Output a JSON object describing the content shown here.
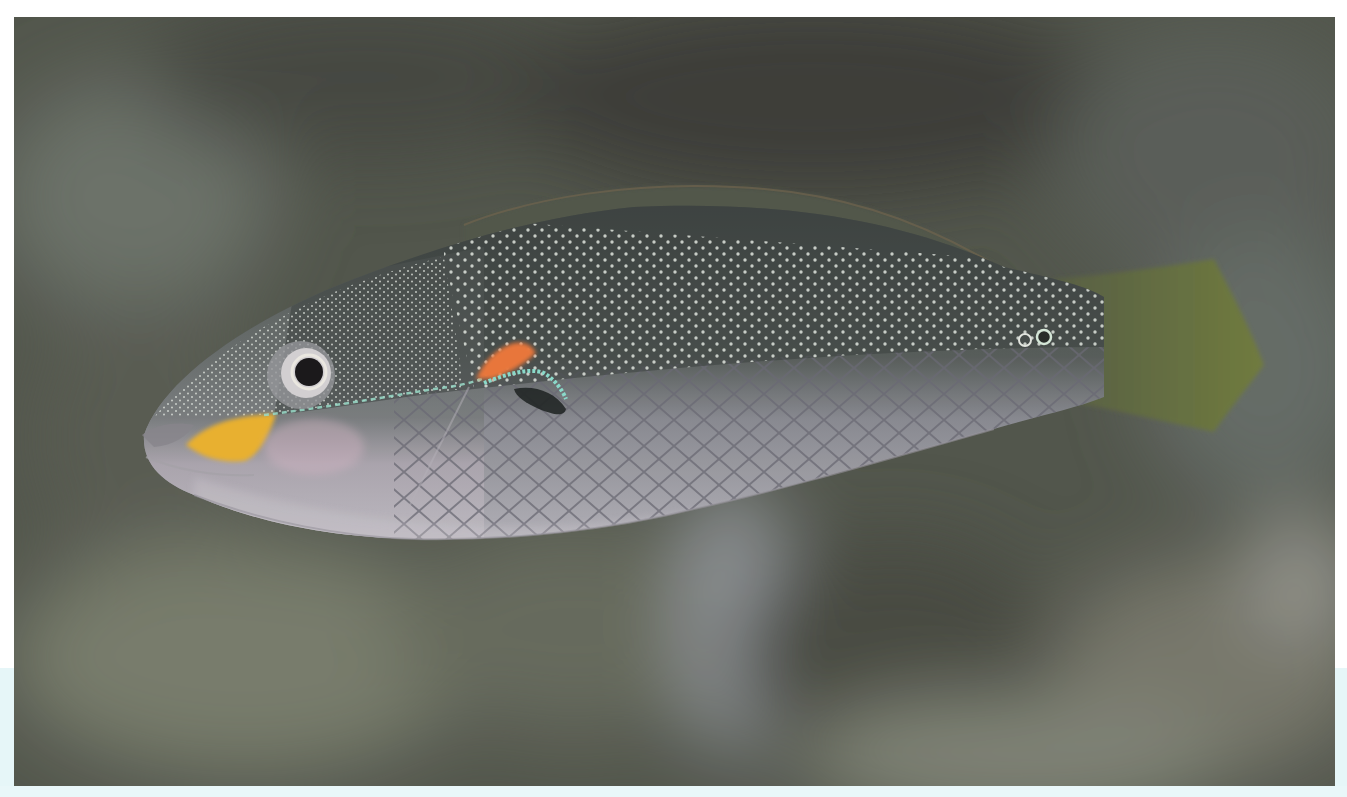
{
  "image": {
    "subject": "wrasse fish swimming left, side view",
    "colors": {
      "background_dark": "#4a4d45",
      "background_mid": "#6b7063",
      "background_light": "#8e9587",
      "body_upper": "#4e5552",
      "body_lower": "#b9b8bd",
      "spots": "#e8ece6",
      "yellow_patch": "#f2b935",
      "orange_patch": "#f07a3c",
      "teal_line": "#9fe3cf",
      "tail": "#6f7a44",
      "page_margin": "#ffffff",
      "cyan_band": "#e6f6f8"
    }
  }
}
